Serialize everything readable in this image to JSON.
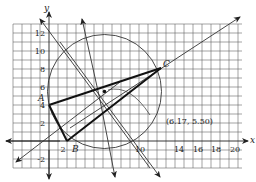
{
  "figure": {
    "type": "coordinate-geometry",
    "axes": {
      "x_label": "x",
      "y_label": "y",
      "x_ticks": [
        "2",
        "10",
        "14",
        "16",
        "18",
        "20"
      ],
      "y_ticks": [
        "12",
        "10",
        "8",
        "6",
        "4",
        "2",
        "-2"
      ]
    },
    "points": {
      "A": {
        "label": "A",
        "x": 0,
        "y": 4
      },
      "B": {
        "label": "B",
        "x": 2,
        "y": 0
      },
      "C": {
        "label": "C",
        "x": 12.5,
        "y": 8
      }
    },
    "circumcenter": {
      "label": "(6.17, 5.50)",
      "x": 6.17,
      "y": 5.5
    },
    "colors": {
      "ink": "#222222",
      "grid": "#555555",
      "background": "#ffffff"
    }
  }
}
